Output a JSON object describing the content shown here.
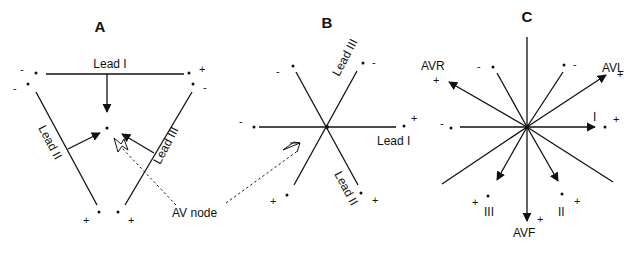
{
  "panels": {
    "A": {
      "title": "A",
      "lead_labels": [
        "Lead I",
        "Lead II",
        "Lead III"
      ],
      "signs": {
        "top_left_1": "-",
        "top_left_2": "-",
        "top_right_1": "+",
        "top_right_2": "-",
        "bottom_left": "+",
        "bottom_right": "+"
      }
    },
    "B": {
      "title": "B",
      "lead_labels": [
        "Lead I",
        "Lead II",
        "Lead III"
      ],
      "signs": {
        "left": "-",
        "right": "+",
        "upper_left": "-",
        "upper_right": "-",
        "lower_left": "+",
        "lower_right": "+"
      }
    },
    "C": {
      "title": "C",
      "lead_labels": [
        "AVR",
        "AVL",
        "I",
        "III",
        "AVF",
        "II"
      ],
      "signs": {
        "avr": "+",
        "avl": "+",
        "i": "+",
        "iii": "+",
        "avf": "+",
        "ii": "+",
        "left": "-",
        "upper_left": "-",
        "upper_right": "-"
      }
    }
  },
  "annotation": {
    "av_node": "AV node"
  }
}
